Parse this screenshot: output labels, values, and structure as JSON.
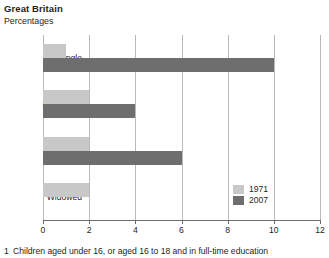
{
  "header": {
    "title": "Great Britain",
    "subtitle": "Percentages"
  },
  "footnote": {
    "marker": "1",
    "text": "Children aged under 16, or aged 16 to 18 and in full-time education"
  },
  "colors": {
    "series_1971": "#c8c8c8",
    "series_2007": "#6e6e6e",
    "gridline": "#b9b9b9",
    "axis": "#6d6d6d",
    "text": "#231f20"
  },
  "chart_data": {
    "type": "bar",
    "orientation": "horizontal",
    "title": "Great Britain",
    "subtitle": "Percentages",
    "xlabel": "",
    "ylabel": "",
    "xlim": [
      0,
      12
    ],
    "xticks": [
      0,
      2,
      4,
      6,
      8,
      10,
      12
    ],
    "xtick_labels": [
      "0",
      "2",
      "4",
      "6",
      "8",
      "10",
      "12"
    ],
    "grid": "vertical",
    "legend_position": "bottom-right-inside",
    "categories": [
      "Single",
      "Separated",
      "Divorced",
      "Widowed"
    ],
    "series": [
      {
        "name": "1971",
        "color": "#c8c8c8",
        "values": [
          1,
          2,
          2,
          2
        ]
      },
      {
        "name": "2007",
        "color": "#6e6e6e",
        "values": [
          10,
          4,
          6,
          0
        ]
      }
    ]
  }
}
